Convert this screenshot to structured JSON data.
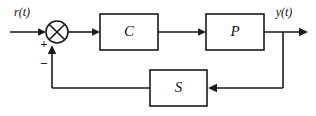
{
  "diagram": {
    "type": "control-system-block-diagram",
    "canvas": {
      "width": 316,
      "height": 116,
      "background": "#ffffff"
    },
    "stroke_color": "#1a1a1a",
    "blocks": [
      {
        "id": "controller",
        "label": "C",
        "x": 100,
        "y": 14,
        "w": 58,
        "h": 36
      },
      {
        "id": "plant",
        "label": "P",
        "x": 206,
        "y": 14,
        "w": 58,
        "h": 36
      },
      {
        "id": "sensor",
        "label": "S",
        "x": 150,
        "y": 70,
        "w": 57,
        "h": 36
      }
    ],
    "summing_junction": {
      "id": "sum",
      "cx": 57,
      "cy": 32,
      "r": 11,
      "style": "crossed-circle",
      "inputs": [
        {
          "label": "+",
          "from": "reference",
          "side": "left"
        },
        {
          "label": "–",
          "from": "feedback",
          "side": "bottom"
        }
      ]
    },
    "signals": [
      {
        "id": "reference",
        "label": "r(t)",
        "x": 22,
        "y": 13
      },
      {
        "id": "output",
        "label": "y(t)",
        "x": 284,
        "y": 13
      }
    ],
    "sign_markers": [
      {
        "id": "plus-sign",
        "label": "+",
        "x": 44,
        "y": 45
      },
      {
        "id": "minus-sign",
        "label": "–",
        "x": 44,
        "y": 63
      }
    ],
    "wires": [
      {
        "id": "ref-to-sum",
        "from": "reference",
        "to": "sum"
      },
      {
        "id": "sum-to-c",
        "from": "sum",
        "to": "controller"
      },
      {
        "id": "c-to-p",
        "from": "controller",
        "to": "plant"
      },
      {
        "id": "p-to-output",
        "from": "plant",
        "to": "output"
      },
      {
        "id": "output-to-s",
        "from": "output",
        "to": "sensor"
      },
      {
        "id": "s-to-sum",
        "from": "sensor",
        "to": "sum"
      }
    ]
  }
}
